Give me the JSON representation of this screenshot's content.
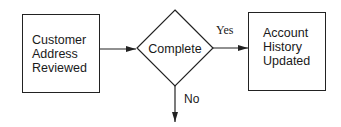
{
  "diagram": {
    "type": "flowchart",
    "nodes": [
      {
        "id": "customer_address_reviewed",
        "shape": "rectangle",
        "lines": [
          "Customer",
          "Address",
          "Reviewed"
        ]
      },
      {
        "id": "complete",
        "shape": "diamond",
        "label": "Complete"
      },
      {
        "id": "account_history_updated",
        "shape": "rectangle",
        "lines": [
          "Account",
          "History",
          "Updated"
        ]
      }
    ],
    "edges": [
      {
        "from": "customer_address_reviewed",
        "to": "complete",
        "label": ""
      },
      {
        "from": "complete",
        "to": "account_history_updated",
        "label": "Yes"
      },
      {
        "from": "complete",
        "to": "(off-diagram)",
        "label": "No"
      }
    ],
    "colors": {
      "stroke": "#222222",
      "background": "#ffffff",
      "text": "#1a1a1a"
    }
  }
}
